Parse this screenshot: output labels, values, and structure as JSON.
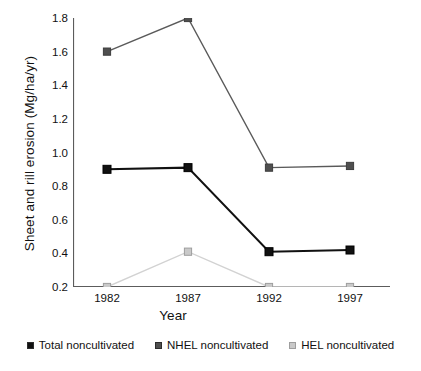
{
  "chart_data": {
    "type": "line",
    "title": "",
    "xlabel": "Year",
    "ylabel": "Sheet and rill erosion (Mg/ha/yr)",
    "categories": [
      "1982",
      "1987",
      "1992",
      "1997"
    ],
    "x": [
      1982,
      1987,
      1992,
      1997
    ],
    "xlim": [
      1980,
      1999
    ],
    "ylim": [
      0.2,
      1.8
    ],
    "yticks": [
      0.2,
      0.4,
      0.6,
      0.8,
      1.0,
      1.2,
      1.4,
      1.6,
      1.8
    ],
    "ytick_labels": [
      "0.2",
      "0.4",
      "0.6",
      "0.8",
      "1.0",
      "1.2",
      "1.4",
      "1.6",
      "1.8"
    ],
    "grid": false,
    "legend_position": "below",
    "marker": "square",
    "series": [
      {
        "name": "Total noncultivated",
        "values": [
          0.9,
          0.91,
          0.41,
          0.42
        ],
        "color": "#111111",
        "marker_fill": "#111111",
        "line_width": 2.0
      },
      {
        "name": "NHEL noncultivated",
        "values": [
          1.6,
          1.8,
          0.91,
          0.92
        ],
        "color": "#5a5a5a",
        "marker_fill": "#4f4f4f",
        "line_width": 1.4
      },
      {
        "name": "HEL noncultivated",
        "values": [
          0.2,
          0.41,
          0.2,
          0.2
        ],
        "color": "#d2d2d2",
        "marker_fill": "#c9c9c9",
        "line_width": 1.4
      }
    ]
  },
  "axes": {
    "y_title": "Sheet and rill erosion (Mg/ha/yr)",
    "x_title": "Year",
    "y_ticks": [
      {
        "label": "1.8",
        "value": 1.8
      },
      {
        "label": "1.6",
        "value": 1.6
      },
      {
        "label": "1.4",
        "value": 1.4
      },
      {
        "label": "1.2",
        "value": 1.2
      },
      {
        "label": "1.0",
        "value": 1.0
      },
      {
        "label": "0.8",
        "value": 0.8
      },
      {
        "label": "0.6",
        "value": 0.6
      },
      {
        "label": "0.4",
        "value": 0.4
      },
      {
        "label": "0.2",
        "value": 0.2
      }
    ],
    "x_ticks": [
      {
        "label": "1982",
        "value": 1982
      },
      {
        "label": "1987",
        "value": 1987
      },
      {
        "label": "1992",
        "value": 1992
      },
      {
        "label": "1997",
        "value": 1997
      }
    ]
  },
  "legend": {
    "entries": [
      {
        "label": "Total noncultivated",
        "color": "#111111"
      },
      {
        "label": "NHEL noncultivated",
        "color": "#4f4f4f"
      },
      {
        "label": "HEL noncultivated",
        "color": "#c9c9c9"
      }
    ]
  },
  "colors": {
    "axis": "#5c5c5c",
    "background": "#ffffff",
    "text": "#111111"
  }
}
